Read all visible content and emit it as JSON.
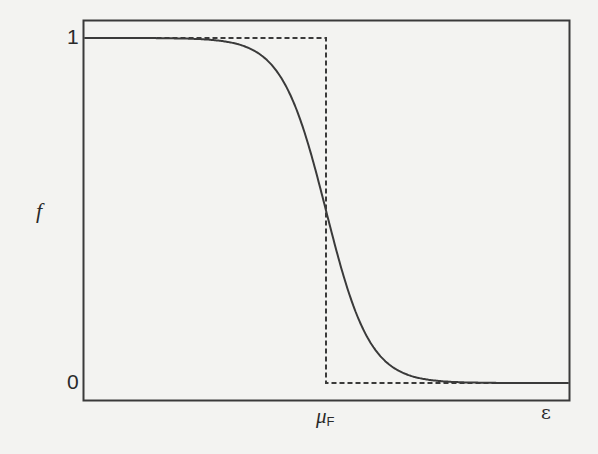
{
  "chart_data": {
    "type": "line",
    "title": "",
    "xlabel": "ε",
    "ylabel": "f",
    "x_tick_labels": [
      {
        "label": "μ",
        "subscript": "F",
        "position": "mu_F"
      }
    ],
    "y_tick_labels": [
      "1",
      "0"
    ],
    "ylim": [
      0,
      1
    ],
    "grid": false,
    "legend": null,
    "series": [
      {
        "name": "Fermi-Dirac distribution (finite temperature)",
        "style": "solid",
        "function": "f(ε) = 1 / (1 + exp((ε - μF) / kT))",
        "x": [
          -11,
          -8,
          -6,
          -5,
          -4,
          -3,
          -2,
          -1.5,
          -1,
          -0.5,
          0,
          0.5,
          1,
          1.5,
          2,
          3,
          4,
          5,
          6,
          8,
          11.3
        ],
        "values": [
          1.0,
          1.0,
          0.998,
          0.993,
          0.982,
          0.953,
          0.881,
          0.818,
          0.731,
          0.622,
          0.5,
          0.378,
          0.269,
          0.182,
          0.119,
          0.047,
          0.018,
          0.007,
          0.002,
          0.0,
          0.0
        ]
      },
      {
        "name": "Step function (T = 0)",
        "style": "dashed",
        "x": [
          -11,
          0,
          0,
          11.3
        ],
        "values": [
          1,
          1,
          0,
          0
        ]
      }
    ],
    "annotations": [
      "horizontal dashed line at f=0",
      "vertical dashed line at ε = μF"
    ]
  },
  "labels": {
    "y_axis": "f",
    "y_tick_top": "1",
    "y_tick_bottom": "0",
    "x_axis": "ε",
    "x_tick_mu": "μ",
    "x_tick_mu_sub": "F"
  },
  "colors": {
    "background": "#f3f3f1",
    "ink": "#3a3a3a"
  }
}
